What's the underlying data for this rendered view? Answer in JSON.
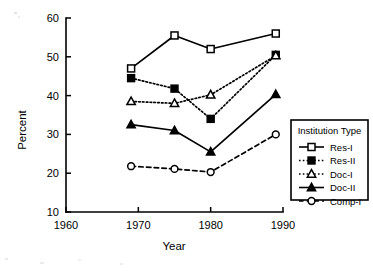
{
  "chart_data": {
    "type": "line",
    "title": "",
    "xlabel": "Year",
    "ylabel": "Percent",
    "x": [
      1969,
      1975,
      1980,
      1989
    ],
    "xlim": [
      1960,
      1990
    ],
    "ylim": [
      10,
      60
    ],
    "xticks": [
      1960,
      1970,
      1980,
      1990
    ],
    "yticks": [
      10,
      20,
      30,
      40,
      50,
      60
    ],
    "xtick_labels": [
      "1960",
      "1970",
      "1980",
      "1990"
    ],
    "ytick_labels": [
      "10",
      "20",
      "30",
      "40",
      "50",
      "60"
    ],
    "grid": false,
    "legend_title": "Institution Type",
    "legend_position": "right",
    "series": [
      {
        "name": "Res-I",
        "values": [
          47,
          55.5,
          52,
          56
        ],
        "line_style": "solid",
        "marker": "open-square"
      },
      {
        "name": "Res-II",
        "values": [
          44.5,
          41.8,
          34,
          50.5
        ],
        "line_style": "dotted",
        "marker": "filled-square"
      },
      {
        "name": "Doc-I",
        "values": [
          38.5,
          38,
          40.2,
          50.3
        ],
        "line_style": "dotted",
        "marker": "open-triangle"
      },
      {
        "name": "Doc-II",
        "values": [
          32.5,
          31,
          25.5,
          40.3
        ],
        "line_style": "solid",
        "marker": "filled-triangle"
      },
      {
        "name": "Comp-I",
        "values": [
          21.8,
          21.1,
          20.3,
          30
        ],
        "line_style": "dashed",
        "marker": "open-circle"
      }
    ]
  },
  "colors": {
    "ink": "#000000",
    "paper": "#ffffff"
  }
}
